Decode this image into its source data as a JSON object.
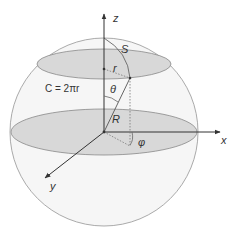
{
  "diagram": {
    "labels": {
      "z_axis": "z",
      "x_axis": "x",
      "y_axis": "y",
      "arc_length": "S",
      "small_radius": "r",
      "circumference": "C = 2πr",
      "polar_angle": "θ",
      "sphere_radius": "R",
      "azimuth_angle": "φ"
    },
    "colors": {
      "sphere_fill": "#f4f4f4",
      "sphere_stroke": "#9a9a9a",
      "disk_fill": "#d6d6d6",
      "disk_stroke": "#8a8a8a",
      "axis": "#333333",
      "dotted": "#777777",
      "text": "#333333"
    }
  }
}
